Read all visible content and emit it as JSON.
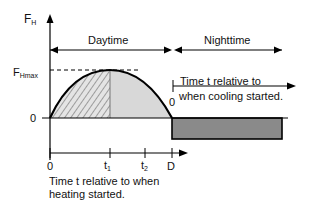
{
  "diagram": {
    "y_axis_label": {
      "main": "F",
      "sub": "H"
    },
    "peak_label": {
      "main": "F",
      "sub": "Hmax"
    },
    "zero_label": "0",
    "periods": {
      "day": "Daytime",
      "night": "Nighttime"
    },
    "x_ticks": {
      "origin": "0",
      "t1": {
        "main": "t",
        "sub": "1"
      },
      "t2": {
        "main": "t",
        "sub": "2"
      },
      "D": "D"
    },
    "heating_axis_caption": [
      "Time t relative to when",
      "heating started."
    ],
    "cooling_axis": {
      "origin": "0",
      "caption": [
        "Time t relative to",
        "when cooling started."
      ]
    },
    "regions": [
      {
        "name": "heating-rising",
        "fill": "hatched"
      },
      {
        "name": "heating-falling",
        "fill": "#d6d6d6"
      },
      {
        "name": "cooling",
        "fill": "#8a8a8a"
      }
    ]
  }
}
